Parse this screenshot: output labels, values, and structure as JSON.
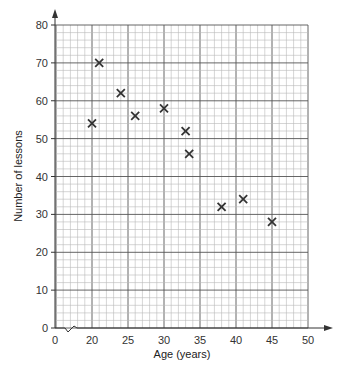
{
  "chart_data": {
    "type": "scatter",
    "title": "",
    "xlabel": "Age (years)",
    "ylabel": "Number of lessons",
    "xlim": [
      0,
      50
    ],
    "ylim": [
      0,
      80
    ],
    "x_axis_break": true,
    "x_ticks": [
      0,
      20,
      25,
      30,
      35,
      40,
      45,
      50
    ],
    "y_ticks": [
      0,
      10,
      20,
      30,
      40,
      50,
      60,
      70,
      80
    ],
    "grid": true,
    "marker": "x",
    "points": [
      {
        "x": 20,
        "y": 54
      },
      {
        "x": 21,
        "y": 70
      },
      {
        "x": 24,
        "y": 62
      },
      {
        "x": 26,
        "y": 56
      },
      {
        "x": 30,
        "y": 58
      },
      {
        "x": 33,
        "y": 52
      },
      {
        "x": 33.5,
        "y": 46
      },
      {
        "x": 38,
        "y": 32
      },
      {
        "x": 41,
        "y": 34
      },
      {
        "x": 45,
        "y": 28
      }
    ]
  },
  "axes": {
    "xlabel": "Age (years)",
    "ylabel": "Number of lessons"
  },
  "colors": {
    "grid_minor": "#b8b8b8",
    "grid_major": "#555555",
    "marker": "#333333"
  }
}
